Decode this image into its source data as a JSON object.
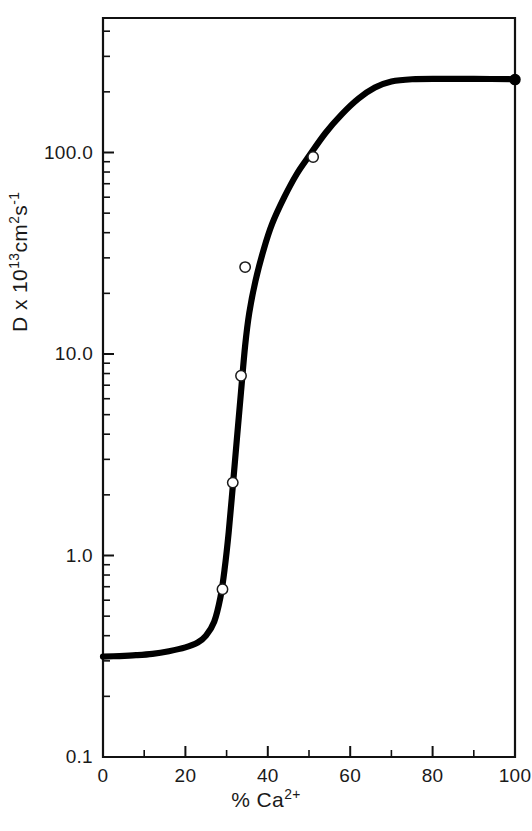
{
  "chart_data": {
    "type": "line",
    "title": "",
    "subtitle": "",
    "xlabel": "% Ca2+",
    "xlabel_parts": {
      "prefix": "% Ca",
      "sup": "2+"
    },
    "ylabel": "D x 10^13 cm^2 s^-1",
    "ylabel_parts": {
      "a": "D",
      "b": " x 10",
      "b_sup": "13",
      "c": "cm",
      "c_sup": "2",
      "d": "s",
      "d_sup": "-1"
    },
    "xscale": "linear",
    "yscale": "log",
    "xlim": [
      0,
      100
    ],
    "ylim": [
      0.1,
      450
    ],
    "grid": false,
    "legend": null,
    "frame": "box",
    "x_ticks_major": [
      0,
      20,
      40,
      60,
      80,
      100
    ],
    "x_tick_labels": [
      "0",
      "20",
      "40",
      "60",
      "80",
      "100"
    ],
    "x_ticks_minor": [
      10,
      30,
      50,
      70,
      90
    ],
    "y_ticks_major": [
      0.1,
      1.0,
      10.0,
      100.0
    ],
    "y_tick_labels": [
      "0.1",
      "1.0",
      "10.0",
      "100.0"
    ],
    "y_ticks_minor_per_decade": [
      2,
      3,
      4,
      5,
      6,
      7,
      8,
      9
    ],
    "series": [
      {
        "name": "measured diffusion coefficient",
        "marker": "open-circle",
        "points": [
          {
            "x": 29,
            "y": 0.68
          },
          {
            "x": 31.5,
            "y": 2.3
          },
          {
            "x": 33.5,
            "y": 7.8
          },
          {
            "x": 34.5,
            "y": 27
          },
          {
            "x": 51,
            "y": 95
          },
          {
            "x": 100,
            "y": 230
          }
        ],
        "point_markers": [
          "open-circle",
          "open-circle",
          "open-circle",
          "open-circle",
          "open-circle",
          "filled-circle"
        ]
      },
      {
        "name": "fitted sigmoid curve",
        "marker": "none",
        "curve": [
          {
            "x": 0,
            "y": 0.315
          },
          {
            "x": 4,
            "y": 0.317
          },
          {
            "x": 8,
            "y": 0.32
          },
          {
            "x": 12,
            "y": 0.325
          },
          {
            "x": 16,
            "y": 0.335
          },
          {
            "x": 20,
            "y": 0.35
          },
          {
            "x": 23,
            "y": 0.37
          },
          {
            "x": 25,
            "y": 0.4
          },
          {
            "x": 27,
            "y": 0.47
          },
          {
            "x": 28.5,
            "y": 0.62
          },
          {
            "x": 29.5,
            "y": 0.85
          },
          {
            "x": 30.5,
            "y": 1.3
          },
          {
            "x": 31.5,
            "y": 2.2
          },
          {
            "x": 32.5,
            "y": 3.8
          },
          {
            "x": 33.5,
            "y": 6.5
          },
          {
            "x": 34.5,
            "y": 11
          },
          {
            "x": 35.5,
            "y": 16
          },
          {
            "x": 37,
            "y": 23
          },
          {
            "x": 39,
            "y": 33
          },
          {
            "x": 41,
            "y": 44
          },
          {
            "x": 44,
            "y": 60
          },
          {
            "x": 47,
            "y": 78
          },
          {
            "x": 50,
            "y": 96
          },
          {
            "x": 54,
            "y": 125
          },
          {
            "x": 58,
            "y": 155
          },
          {
            "x": 62,
            "y": 185
          },
          {
            "x": 66,
            "y": 210
          },
          {
            "x": 70,
            "y": 225
          },
          {
            "x": 75,
            "y": 231
          },
          {
            "x": 82,
            "y": 232
          },
          {
            "x": 90,
            "y": 232
          },
          {
            "x": 100,
            "y": 231
          }
        ]
      }
    ]
  },
  "axes_geometry": {
    "note": "pixel mapping used to render the figure frame",
    "plot_left": 103,
    "plot_right": 515,
    "plot_top": 18,
    "plot_bottom": 757,
    "decade_px": 201.5,
    "y_ref_value": 0.1
  }
}
